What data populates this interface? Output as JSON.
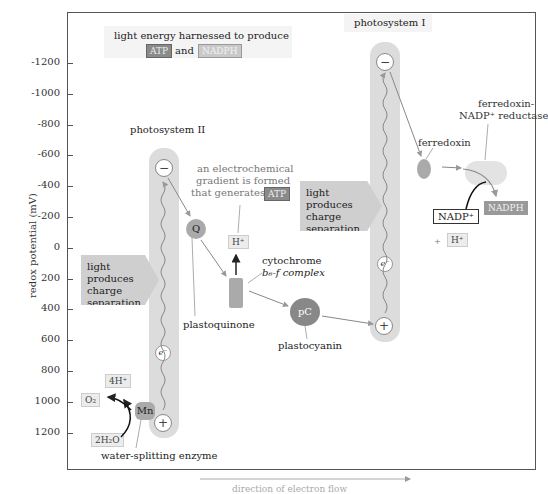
{
  "chart_data": {
    "type": "diagram",
    "ylabel": "redox potential (mV)",
    "xlabel": "direction of electron flow",
    "y_ticks": [
      "-1200",
      "-1000",
      "-800",
      "-600",
      "-400",
      "-200",
      "0",
      "200",
      "400",
      "600",
      "800",
      "1000",
      "1200"
    ],
    "ylim": [
      -1200,
      1200
    ]
  },
  "header": {
    "line1": "light energy harnessed to produce",
    "atp": "ATP",
    "and": "and",
    "nadph": "NADPH"
  },
  "ps2": {
    "label": "photosystem II",
    "minus": "−",
    "plus": "+",
    "electron": "e⁻",
    "light_box": [
      "light",
      "produces",
      "charge",
      "separation"
    ]
  },
  "ps1": {
    "label": "photosystem I",
    "minus": "−",
    "plus": "+",
    "electron": "e⁻",
    "light_box": [
      "light",
      "produces",
      "charge",
      "separation"
    ]
  },
  "gradient": {
    "line1": "an electrochemical",
    "line2": "gradient is formed",
    "line3": "that generates",
    "atp": "ATP",
    "hplus": "H⁺"
  },
  "components": {
    "q": "Q",
    "plastoquinone": "plastoquinone",
    "cytochrome1": "cytochrome",
    "cytochrome2": "b₆-f complex",
    "pc": "pC",
    "plastocyanin": "plastocyanin",
    "ferredoxin": "ferredoxin",
    "fnr1": "ferredoxin-",
    "fnr2": "NADP⁺ reductase",
    "nadp": "NADP⁺",
    "plus": "+",
    "hplus": "H⁺",
    "nadph": "NADPH"
  },
  "water": {
    "h4": "4H⁺",
    "o2": "O₂",
    "h2o": "2H₂O",
    "mn": "Mn",
    "enzyme": "water-splitting enzyme"
  }
}
